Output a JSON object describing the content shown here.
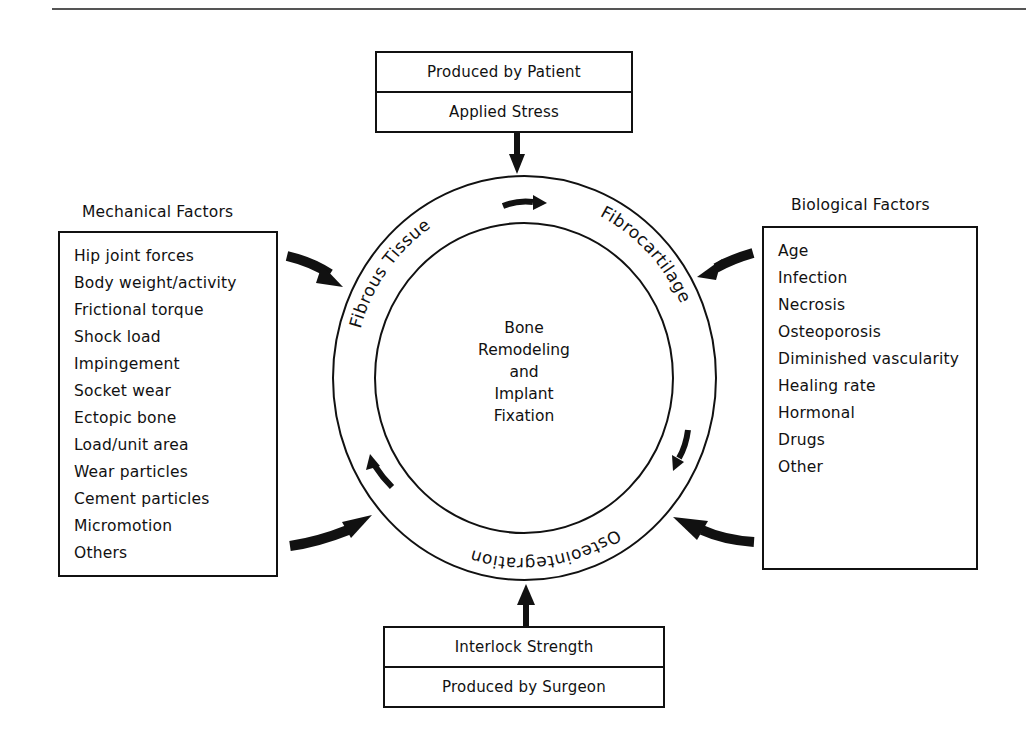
{
  "top_box": {
    "rows": [
      "Produced by Patient",
      "Applied Stress"
    ]
  },
  "bottom_box": {
    "rows": [
      "Interlock Strength",
      "Produced by Surgeon"
    ]
  },
  "mechanical_factors": {
    "title": "Mechanical Factors",
    "items": [
      "Hip joint forces",
      "Body weight/activity",
      "Frictional torque",
      "Shock load",
      "Impingement",
      "Socket wear",
      "Ectopic bone",
      "Load/unit area",
      "Wear particles",
      "Cement particles",
      "Micromotion",
      "Others"
    ]
  },
  "biological_factors": {
    "title": "Biological Factors",
    "items": [
      "Age",
      "Infection",
      "Necrosis",
      "Osteoporosis",
      "Diminished vascularity",
      "Healing rate",
      "Hormonal",
      "Drugs",
      "Other"
    ]
  },
  "cycle": {
    "ring_labels": {
      "left": "Fibrous Tissue",
      "right": "Fibrocartilage",
      "bottom": "Osteointegration"
    },
    "center_lines": [
      "Bone",
      "Remodeling",
      "and",
      "Implant",
      "Fixation"
    ],
    "direction": "clockwise"
  },
  "colors": {
    "ink": "#111111",
    "background": "#ffffff",
    "rule": "#555555"
  }
}
